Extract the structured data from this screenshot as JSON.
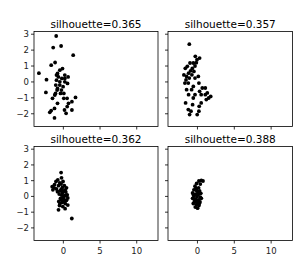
{
  "figure": {
    "width": 302,
    "height": 266,
    "background": "#ffffff",
    "marker_color": "#000000"
  },
  "chart_data": [
    {
      "type": "scatter",
      "title": "silhouette=0.365",
      "xlim": [
        -4.0,
        12.9
      ],
      "ylim": [
        -2.8,
        3.17
      ],
      "xticks": [
        0,
        5,
        10
      ],
      "yticks": [
        3,
        2,
        1,
        0,
        -1,
        -2
      ],
      "show_xtick_labels": false,
      "show_ytick_labels": true,
      "grid": false,
      "points": [
        [
          -0.98,
          2.89
        ],
        [
          -1.39,
          2.16
        ],
        [
          -0.3,
          2.26
        ],
        [
          1.34,
          1.68
        ],
        [
          -3.33,
          0.55
        ],
        [
          -1.66,
          1.05
        ],
        [
          -1.12,
          1.22
        ],
        [
          -2.29,
          0.14
        ],
        [
          -0.12,
          0.84
        ],
        [
          -0.8,
          0.53
        ],
        [
          -0.67,
          0.32
        ],
        [
          -0.94,
          0.11
        ],
        [
          -0.48,
          0.01
        ],
        [
          -1.03,
          -0.2
        ],
        [
          -0.8,
          -0.41
        ],
        [
          0.2,
          0.43
        ],
        [
          0.65,
          0.32
        ],
        [
          0.56,
          -0.09
        ],
        [
          0.2,
          0.01
        ],
        [
          -0.03,
          -0.3
        ],
        [
          -2.38,
          -0.66
        ],
        [
          -1.07,
          -0.72
        ],
        [
          -0.39,
          -0.72
        ],
        [
          0.06,
          -0.72
        ],
        [
          -1.48,
          -1.03
        ],
        [
          0.06,
          -1.03
        ],
        [
          0.51,
          -1.03
        ],
        [
          1.66,
          -0.97
        ],
        [
          1.17,
          -1.24
        ],
        [
          -0.8,
          -1.34
        ],
        [
          0.7,
          -1.34
        ],
        [
          -1.21,
          -1.66
        ],
        [
          0.52,
          -1.55
        ],
        [
          0.16,
          -1.76
        ],
        [
          1.16,
          -1.76
        ],
        [
          -1.66,
          -1.8
        ],
        [
          -1.84,
          -1.91
        ],
        [
          0.38,
          -1.97
        ],
        [
          -1.21,
          -2.26
        ],
        [
          -0.94,
          0.43
        ],
        [
          -0.48,
          -0.2
        ],
        [
          -0.85,
          -0.51
        ],
        [
          -0.26,
          -0.51
        ],
        [
          -1.16,
          -0.82
        ],
        [
          -0.21,
          0.22
        ],
        [
          0.2,
          0.22
        ],
        [
          -0.48,
          0.74
        ]
      ]
    },
    {
      "type": "scatter",
      "title": "silhouette=0.357",
      "xlim": [
        -4.0,
        12.9
      ],
      "ylim": [
        -2.8,
        3.17
      ],
      "xticks": [
        0,
        5,
        10
      ],
      "yticks": [
        3,
        2,
        1,
        0,
        -1,
        -2
      ],
      "show_xtick_labels": false,
      "show_ytick_labels": false,
      "grid": false,
      "points": [
        [
          -1.11,
          2.37
        ],
        [
          -0.29,
          1.61
        ],
        [
          -0.07,
          1.4
        ],
        [
          0.29,
          1.5
        ],
        [
          -0.57,
          1.19
        ],
        [
          -1.02,
          1.19
        ],
        [
          -0.34,
          1.0
        ],
        [
          -0.7,
          0.85
        ],
        [
          -1.38,
          0.98
        ],
        [
          -1.65,
          0.86
        ],
        [
          -0.93,
          0.7
        ],
        [
          -0.48,
          0.66
        ],
        [
          -1.2,
          0.55
        ],
        [
          -1.84,
          0.44
        ],
        [
          -0.75,
          0.45
        ],
        [
          -1.11,
          0.24
        ],
        [
          -1.56,
          0.13
        ],
        [
          -0.34,
          0.24
        ],
        [
          0.11,
          0.35
        ],
        [
          -1.7,
          -0.07
        ],
        [
          -1.25,
          -0.07
        ],
        [
          0.2,
          -0.07
        ],
        [
          -0.57,
          -0.28
        ],
        [
          0.65,
          -0.38
        ],
        [
          1.06,
          -0.38
        ],
        [
          -1.47,
          -0.49
        ],
        [
          -0.79,
          -0.49
        ],
        [
          0.29,
          -0.59
        ],
        [
          1.33,
          -0.69
        ],
        [
          -1.2,
          -0.8
        ],
        [
          -0.34,
          -0.8
        ],
        [
          0.51,
          -0.8
        ],
        [
          1.06,
          -0.8
        ],
        [
          1.79,
          -0.91
        ],
        [
          -0.57,
          -1.01
        ],
        [
          1.2,
          -1.11
        ],
        [
          -1.61,
          -1.32
        ],
        [
          0.51,
          -1.32
        ],
        [
          -0.66,
          -1.43
        ],
        [
          0.24,
          -1.53
        ],
        [
          -1.25,
          -1.74
        ],
        [
          -0.88,
          -1.84
        ],
        [
          0.2,
          -1.84
        ],
        [
          -1.07,
          -2.05
        ],
        [
          -0.03,
          -2.05
        ],
        [
          1.52,
          -1.01
        ],
        [
          -0.16,
          1.21
        ],
        [
          -1.47,
          0.34
        ]
      ]
    },
    {
      "type": "scatter",
      "title": "silhouette=0.362",
      "xlim": [
        -4.0,
        12.9
      ],
      "ylim": [
        -2.8,
        3.17
      ],
      "xticks": [
        0,
        5,
        10
      ],
      "yticks": [
        3,
        2,
        1,
        0,
        -1,
        -2
      ],
      "show_xtick_labels": true,
      "show_ytick_labels": true,
      "grid": false,
      "points": [
        [
          -0.3,
          1.51
        ],
        [
          -0.25,
          1.18
        ],
        [
          -0.75,
          1.05
        ],
        [
          -1.0,
          0.95
        ],
        [
          -0.48,
          0.85
        ],
        [
          -1.2,
          0.75
        ],
        [
          -1.52,
          0.62
        ],
        [
          -1.25,
          0.55
        ],
        [
          -0.93,
          0.48
        ],
        [
          -1.43,
          0.42
        ],
        [
          -0.66,
          0.68
        ],
        [
          -0.3,
          0.78
        ],
        [
          -0.12,
          0.58
        ],
        [
          0.15,
          0.68
        ],
        [
          0.43,
          0.55
        ],
        [
          -0.45,
          0.35
        ],
        [
          -0.03,
          0.35
        ],
        [
          0.34,
          0.28
        ],
        [
          -0.57,
          0.15
        ],
        [
          -0.21,
          0.08
        ],
        [
          0.15,
          0.05
        ],
        [
          0.52,
          0.1
        ],
        [
          -0.39,
          -0.12
        ],
        [
          0.06,
          -0.15
        ],
        [
          0.43,
          -0.25
        ],
        [
          -0.62,
          -0.32
        ],
        [
          -0.16,
          -0.38
        ],
        [
          0.25,
          -0.45
        ],
        [
          0.61,
          -0.55
        ],
        [
          -0.52,
          -0.58
        ],
        [
          -0.07,
          -0.65
        ],
        [
          -0.66,
          -0.85
        ],
        [
          0.24,
          -0.78
        ],
        [
          1.15,
          -1.4
        ],
        [
          -0.12,
          0.25
        ],
        [
          0.02,
          -0.05
        ],
        [
          -0.3,
          0.45
        ],
        [
          0.25,
          0.42
        ],
        [
          0.15,
          -0.3
        ],
        [
          -0.25,
          -0.2
        ],
        [
          0.4,
          0.05
        ],
        [
          -0.8,
          0.3
        ],
        [
          -0.05,
          0.95
        ],
        [
          0.6,
          -0.1
        ],
        [
          -0.45,
          -0.45
        ]
      ]
    },
    {
      "type": "scatter",
      "title": "silhouette=0.388",
      "xlim": [
        -4.0,
        12.9
      ],
      "ylim": [
        -2.8,
        3.17
      ],
      "xticks": [
        0,
        5,
        10
      ],
      "yticks": [
        3,
        2,
        1,
        0,
        -1,
        -2
      ],
      "show_xtick_labels": true,
      "show_ytick_labels": false,
      "grid": false,
      "points": [
        [
          0.52,
          1.02
        ],
        [
          0.2,
          0.98
        ],
        [
          0.75,
          0.98
        ],
        [
          -0.12,
          0.82
        ],
        [
          0.38,
          0.78
        ],
        [
          -0.34,
          0.65
        ],
        [
          0.15,
          0.55
        ],
        [
          -0.48,
          0.42
        ],
        [
          -0.12,
          0.38
        ],
        [
          0.29,
          0.35
        ],
        [
          -0.66,
          0.22
        ],
        [
          -0.25,
          0.15
        ],
        [
          0.11,
          0.12
        ],
        [
          -0.48,
          0.02
        ],
        [
          -0.07,
          -0.02
        ],
        [
          0.38,
          -0.05
        ],
        [
          -0.66,
          -0.12
        ],
        [
          -0.25,
          -0.18
        ],
        [
          0.15,
          -0.22
        ],
        [
          0.52,
          -0.12
        ],
        [
          -0.39,
          -0.32
        ],
        [
          0.02,
          -0.38
        ],
        [
          0.34,
          -0.35
        ],
        [
          -0.57,
          -0.45
        ],
        [
          -0.16,
          -0.52
        ],
        [
          0.2,
          -0.58
        ],
        [
          -0.3,
          -0.68
        ],
        [
          0.02,
          -0.75
        ],
        [
          -0.48,
          -0.15
        ],
        [
          0.06,
          0.25
        ],
        [
          -0.21,
          0.5
        ],
        [
          0.45,
          0.2
        ],
        [
          -0.55,
          0.1
        ],
        [
          0.25,
          -0.45
        ],
        [
          -0.1,
          -0.25
        ]
      ]
    }
  ],
  "panels": [
    {
      "title": "silhouette=0.365"
    },
    {
      "title": "silhouette=0.357"
    },
    {
      "title": "silhouette=0.362"
    },
    {
      "title": "silhouette=0.388"
    }
  ]
}
